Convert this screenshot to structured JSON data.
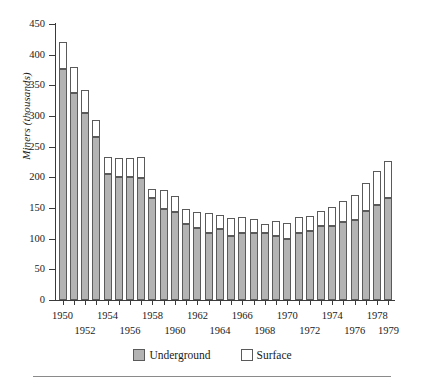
{
  "chart_data": {
    "type": "bar",
    "stacked": true,
    "title": "",
    "xlabel": "",
    "ylabel": "Miners (thousands)",
    "ylim": [
      0,
      450
    ],
    "ytick_step": 50,
    "yticks": [
      450,
      400,
      350,
      300,
      250,
      200,
      150,
      100,
      50,
      0
    ],
    "grid": false,
    "legend_position": "bottom-center",
    "legend": [
      "Underground",
      "Surface"
    ],
    "colors": {
      "underground": "#b3b3b3",
      "surface": "#ffffff",
      "outline": "#5a5a5a",
      "axis": "#3a3a3a",
      "rule": "#8a8a8a"
    },
    "categories": [
      "1950",
      "1951",
      "1952",
      "1953",
      "1954",
      "1955",
      "1956",
      "1957",
      "1958",
      "1959",
      "1960",
      "1961",
      "1962",
      "1963",
      "1964",
      "1965",
      "1966",
      "1967",
      "1968",
      "1969",
      "1970",
      "1971",
      "1972",
      "1973",
      "1974",
      "1975",
      "1976",
      "1977",
      "1978",
      "1979"
    ],
    "xtick_labels_row_a": [
      "1950",
      "1954",
      "1958",
      "1962",
      "1966",
      "1970",
      "1974",
      "1978"
    ],
    "xtick_labels_row_b": [
      "1952",
      "1956",
      "1960",
      "1964",
      "1968",
      "1972",
      "1976",
      "1979"
    ],
    "series": [
      {
        "name": "Underground",
        "values": [
          377,
          338,
          305,
          266,
          205,
          200,
          200,
          199,
          166,
          148,
          144,
          124,
          117,
          110,
          115,
          105,
          110,
          110,
          110,
          105,
          100,
          110,
          112,
          120,
          120,
          128,
          130,
          145,
          155,
          167
        ]
      },
      {
        "name": "Surface",
        "values": [
          43,
          42,
          37,
          27,
          28,
          31,
          32,
          35,
          15,
          32,
          26,
          25,
          27,
          32,
          24,
          28,
          26,
          22,
          14,
          24,
          25,
          25,
          25,
          25,
          32,
          33,
          42,
          45,
          56,
          60
        ]
      }
    ],
    "totals": [
      420,
      380,
      342,
      293,
      233,
      231,
      232,
      234,
      181,
      180,
      170,
      149,
      144,
      142,
      139,
      133,
      136,
      132,
      124,
      129,
      125,
      135,
      137,
      145,
      152,
      161,
      172,
      190,
      211,
      227
    ]
  },
  "legend": {
    "underground_label": "Underground",
    "surface_label": "Surface"
  },
  "axis": {
    "y_title": "Miners (thousands)"
  }
}
